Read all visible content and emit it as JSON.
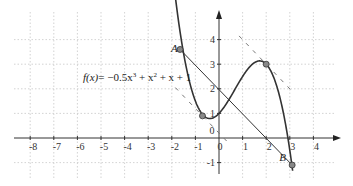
{
  "chart_data": {
    "type": "line",
    "title": "",
    "function_label": "f(x) = −0.5x³ + x² + x + 1",
    "function_label_parts": {
      "fx": "f(x)",
      "rhs": "= −0.5x",
      "exp1": "3",
      "p2": " + x",
      "exp2": "2",
      "p3": " + x + 1"
    },
    "coefficients": {
      "a3": -0.5,
      "a2": 1,
      "a1": 1,
      "a0": 1
    },
    "x_range": [
      -8.5,
      4.8
    ],
    "y_range": [
      -1.4,
      4.7
    ],
    "x_ticks": [
      -8,
      -7,
      -6,
      -5,
      -4,
      -3,
      -2,
      -1,
      0,
      1,
      2,
      3,
      4
    ],
    "x_tick_labels": [
      "-8",
      "-7",
      "-6",
      "-5",
      "-4",
      "-3",
      "-2",
      "-1",
      "0",
      "1",
      "2",
      "3",
      "4"
    ],
    "y_ticks": [
      -1,
      1,
      2,
      3,
      4
    ],
    "y_tick_labels": [
      "-1",
      "1",
      "2",
      "3",
      "4"
    ],
    "origin_label": "0",
    "grid": true,
    "curve_domain": [
      -1.85,
      3.12
    ],
    "points": [
      {
        "name": "A",
        "x": -1.65,
        "y": 3.6,
        "label": "A"
      },
      {
        "name": "B",
        "x": 3.1,
        "y": -1.1,
        "label": "B"
      },
      {
        "name": "local-min",
        "x": -0.7,
        "y": 0.9,
        "label": ""
      },
      {
        "name": "local-max",
        "x": 2.0,
        "y": 3.0,
        "label": ""
      }
    ],
    "segment_AB": {
      "from": "A",
      "to": "B"
    },
    "tangent_lines": [
      {
        "at": "local-min",
        "slope": -1.0
      },
      {
        "at": "local-max",
        "slope": -1.0
      }
    ]
  }
}
